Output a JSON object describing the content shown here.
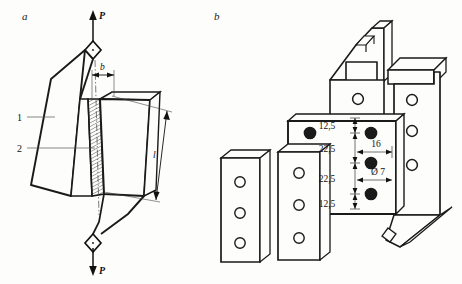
{
  "figure": {
    "panel_a": {
      "label": "a",
      "load_top": "P",
      "load_bottom": "P",
      "dim_width": "b",
      "dim_length": "l",
      "callout_1": "1",
      "callout_2": "2"
    },
    "panel_b": {
      "label": "b",
      "dimensions": [
        {
          "name": "edge-top",
          "value": "12,5"
        },
        {
          "name": "pitch-upper",
          "value": "22,5"
        },
        {
          "name": "pitch-lower",
          "value": "22,5"
        },
        {
          "name": "edge-bottom",
          "value": "12,5"
        },
        {
          "name": "horizontal-offset",
          "value": "16"
        },
        {
          "name": "hole-diameter",
          "value": "Ø 7"
        }
      ]
    }
  },
  "colors": {
    "ink": "#111111",
    "outline": "#1a1a1a",
    "thin_line": "#4a4a4a",
    "hatch": "#2b2b2b",
    "paper": "#fdfdfb"
  }
}
